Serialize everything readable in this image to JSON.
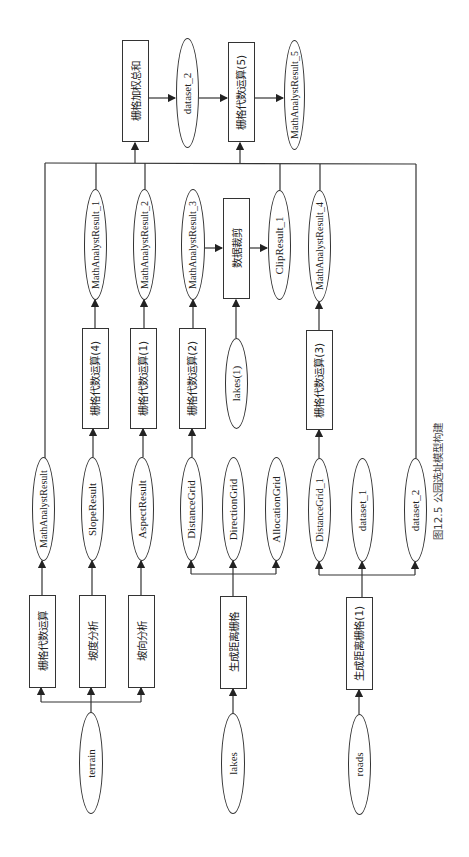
{
  "caption": "图12.5   公园选址模型构建",
  "nodes": {
    "terrain": "terrain",
    "lakes": "lakes",
    "roads": "roads",
    "raster_calc": "栅格代数运算",
    "slope": "坡度分析",
    "aspect": "坡向分析",
    "gen_dist": "生成距离栅格",
    "gen_dist_1": "生成距离栅格(1)",
    "math_result": "MathAnalystResult",
    "slope_result": "SlopeResult",
    "aspect_result": "AspectResult",
    "distance_grid": "DistanceGrid",
    "direction_grid": "DirectionGrid",
    "allocation_grid": "AllocationGrid",
    "distance_grid_1": "DistanceGrid_1",
    "dataset_1": "dataset_1",
    "dataset_2_low": "dataset_2",
    "calc4": "栅格代数运算(4)",
    "calc1": "栅格代数运算(1)",
    "calc2": "栅格代数运算(2)",
    "lakes1": "lakes(1)",
    "calc3": "栅格代数运算(3)",
    "mar1": "MathAnalystResult_1",
    "mar2": "MathAnalystResult_2",
    "mar3": "MathAnalystResult_3",
    "clip": "数据裁剪",
    "clip_result": "ClipResult_1",
    "mar4": "MathAnalystResult_4",
    "weighted_sum": "栅格加权总和",
    "dataset_2_top": "dataset_2",
    "calc5": "栅格代数运算(5)",
    "mar5": "MathAnalystResult_5"
  },
  "colors": {
    "line": "#333333",
    "background": "#ffffff"
  }
}
